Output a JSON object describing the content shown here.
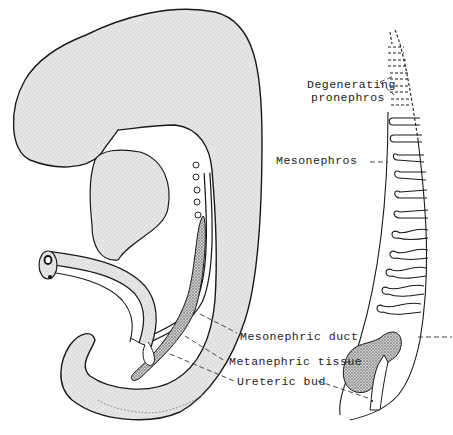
{
  "figure": {
    "colors": {
      "stipple_fill": "#e2e2e2",
      "outline": "#1a1a1a",
      "dense_tissue": "#8a8a8a",
      "background": "#ffffff"
    },
    "labels": {
      "degenerating_pronephros_line1": "Degenerating",
      "degenerating_pronephros_line2": "pronephros",
      "mesonephros": "Mesonephros",
      "mesonephric_duct": "Mesonephric duct",
      "metanephric_tissue": "Metanephric tissue",
      "ureteric_bud": "Ureteric bud"
    },
    "panels": [
      {
        "name": "left-panel",
        "content": "Lateral view of the embryo showing mesonephric duct, metanephric tissue and ureteric bud"
      },
      {
        "name": "right-panel",
        "content": "Schematic of nephric structures from pronephros to metanephros"
      }
    ]
  }
}
